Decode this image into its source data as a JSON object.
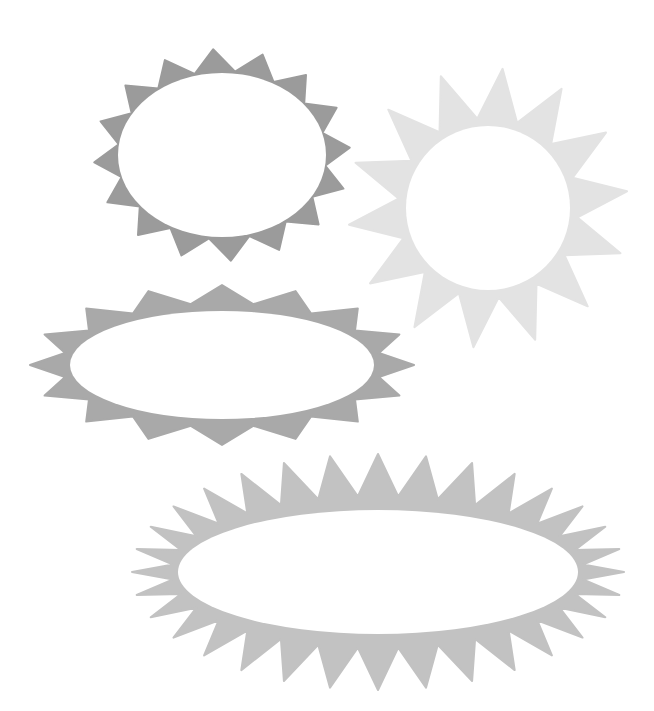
{
  "canvas": {
    "width": 654,
    "height": 711,
    "background": "#ffffff"
  },
  "shapes": [
    {
      "name": "starburst-badge-oval-dark",
      "color": "#9b9b9b",
      "inner_color": "#ffffff",
      "cx": 222,
      "cy": 155,
      "inner_rx": 104,
      "inner_ry": 82,
      "outer_rx": 128,
      "outer_ry": 106,
      "valley_rx": 104,
      "valley_ry": 84,
      "spikes": 16,
      "rotation_deg": -4
    },
    {
      "name": "sun-badge-circle-light",
      "color": "#e3e3e3",
      "inner_color": "#ffffff",
      "cx": 488,
      "cy": 208,
      "inner_rx": 82,
      "inner_ry": 82,
      "outer_rx": 140,
      "outer_ry": 140,
      "valley_rx": 90,
      "valley_ry": 90,
      "spikes": 14,
      "rotation_deg": 6
    },
    {
      "name": "starburst-badge-wide-oval",
      "color": "#a9a9a9",
      "inner_color": "#ffffff",
      "cx": 222,
      "cy": 365,
      "inner_rx": 152,
      "inner_ry": 54,
      "outer_rx": 192,
      "outer_ry": 80,
      "valley_rx": 160,
      "valley_ry": 62,
      "spikes": 16,
      "rotation_deg": 0
    },
    {
      "name": "starburst-badge-long-oval-spiky",
      "color": "#c2c2c2",
      "inner_color": "#ffffff",
      "cx": 378,
      "cy": 572,
      "inner_rx": 200,
      "inner_ry": 62,
      "outer_rx": 246,
      "outer_ry": 118,
      "valley_rx": 206,
      "valley_ry": 76,
      "spikes": 32,
      "rotation_deg": 0
    }
  ]
}
